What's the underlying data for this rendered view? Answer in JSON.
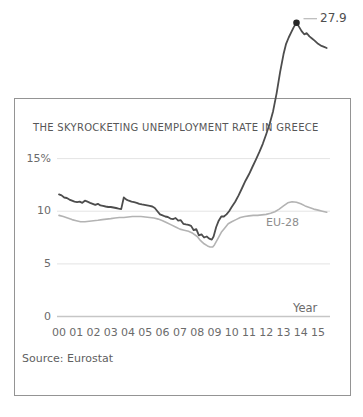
{
  "colors": {
    "greece_line": "#4d4d4d",
    "eu_line": "#b3b3b3",
    "grid": "#e4e4e4",
    "axis": "#c6c6c6",
    "frame": "#949494",
    "dot": "#262626",
    "leader": "#b8b8b8",
    "text": "#5f5f5f"
  },
  "chart_data": {
    "type": "line",
    "title": "THE SKYROCKETING UNEMPLOYMENT RATE IN GREECE",
    "source": "Source: Eurostat",
    "x_axis": {
      "label": "Year",
      "tick_labels": [
        "00",
        "01",
        "02",
        "03",
        "04",
        "05",
        "06",
        "07",
        "08",
        "09",
        "10",
        "11",
        "12",
        "13",
        "14",
        "15"
      ],
      "range_years": [
        2000,
        2015.5
      ]
    },
    "y_axis": {
      "unit": "%",
      "ticks": [
        {
          "label": "15%",
          "value": 15
        },
        {
          "label": "10",
          "value": 10
        },
        {
          "label": "5",
          "value": 5
        },
        {
          "label": "0",
          "value": 0
        }
      ],
      "grid": true
    },
    "annotation": {
      "label": "27.9",
      "year": 2013.75,
      "value": 27.9,
      "marker": "filled-dot"
    },
    "series": [
      {
        "name": "Greece",
        "label": "",
        "color": "#4d4d4d",
        "width": 1.8,
        "points": [
          [
            2000.0,
            11.6
          ],
          [
            2000.15,
            11.5
          ],
          [
            2000.3,
            11.3
          ],
          [
            2000.45,
            11.25
          ],
          [
            2000.6,
            11.1
          ],
          [
            2000.75,
            11.0
          ],
          [
            2000.9,
            10.9
          ],
          [
            2001.05,
            10.85
          ],
          [
            2001.2,
            10.9
          ],
          [
            2001.35,
            10.8
          ],
          [
            2001.5,
            11.0
          ],
          [
            2001.65,
            10.9
          ],
          [
            2001.8,
            10.8
          ],
          [
            2001.95,
            10.7
          ],
          [
            2002.1,
            10.6
          ],
          [
            2002.25,
            10.7
          ],
          [
            2002.4,
            10.55
          ],
          [
            2002.55,
            10.5
          ],
          [
            2002.7,
            10.45
          ],
          [
            2002.85,
            10.4
          ],
          [
            2003.0,
            10.4
          ],
          [
            2003.15,
            10.35
          ],
          [
            2003.3,
            10.3
          ],
          [
            2003.45,
            10.25
          ],
          [
            2003.6,
            10.2
          ],
          [
            2003.75,
            11.3
          ],
          [
            2003.9,
            11.1
          ],
          [
            2004.05,
            11.0
          ],
          [
            2004.2,
            10.9
          ],
          [
            2004.35,
            10.85
          ],
          [
            2004.5,
            10.8
          ],
          [
            2004.65,
            10.7
          ],
          [
            2004.8,
            10.65
          ],
          [
            2004.95,
            10.6
          ],
          [
            2005.1,
            10.55
          ],
          [
            2005.25,
            10.5
          ],
          [
            2005.4,
            10.45
          ],
          [
            2005.55,
            10.3
          ],
          [
            2005.7,
            10.0
          ],
          [
            2005.85,
            9.7
          ],
          [
            2006.0,
            9.6
          ],
          [
            2006.15,
            9.5
          ],
          [
            2006.3,
            9.45
          ],
          [
            2006.45,
            9.3
          ],
          [
            2006.6,
            9.25
          ],
          [
            2006.75,
            9.35
          ],
          [
            2006.9,
            9.1
          ],
          [
            2007.05,
            9.15
          ],
          [
            2007.2,
            8.8
          ],
          [
            2007.35,
            8.75
          ],
          [
            2007.5,
            8.7
          ],
          [
            2007.65,
            8.6
          ],
          [
            2007.8,
            8.2
          ],
          [
            2007.95,
            8.3
          ],
          [
            2008.1,
            7.7
          ],
          [
            2008.25,
            7.8
          ],
          [
            2008.4,
            7.5
          ],
          [
            2008.55,
            7.6
          ],
          [
            2008.7,
            7.4
          ],
          [
            2008.85,
            7.3
          ],
          [
            2008.95,
            7.6
          ],
          [
            2009.1,
            8.5
          ],
          [
            2009.25,
            9.1
          ],
          [
            2009.4,
            9.5
          ],
          [
            2009.55,
            9.5
          ],
          [
            2009.7,
            9.7
          ],
          [
            2009.85,
            10.0
          ],
          [
            2010.0,
            10.4
          ],
          [
            2010.2,
            10.9
          ],
          [
            2010.4,
            11.5
          ],
          [
            2010.6,
            12.2
          ],
          [
            2010.8,
            12.9
          ],
          [
            2011.0,
            13.5
          ],
          [
            2011.2,
            14.2
          ],
          [
            2011.4,
            14.9
          ],
          [
            2011.6,
            15.6
          ],
          [
            2011.8,
            16.4
          ],
          [
            2012.0,
            17.3
          ],
          [
            2012.2,
            18.3
          ],
          [
            2012.4,
            19.5
          ],
          [
            2012.6,
            21.2
          ],
          [
            2012.8,
            23.2
          ],
          [
            2013.0,
            24.9
          ],
          [
            2013.15,
            25.9
          ],
          [
            2013.3,
            26.5
          ],
          [
            2013.45,
            27.0
          ],
          [
            2013.6,
            27.5
          ],
          [
            2013.75,
            27.9
          ],
          [
            2013.9,
            27.5
          ],
          [
            2014.05,
            27.1
          ],
          [
            2014.2,
            26.8
          ],
          [
            2014.35,
            26.9
          ],
          [
            2014.5,
            26.6
          ],
          [
            2014.65,
            26.4
          ],
          [
            2014.8,
            26.2
          ],
          [
            2015.0,
            25.9
          ],
          [
            2015.2,
            25.7
          ],
          [
            2015.35,
            25.6
          ],
          [
            2015.5,
            25.5
          ]
        ]
      },
      {
        "name": "EU-28",
        "label": "EU-28",
        "color": "#b3b3b3",
        "width": 1.6,
        "points": [
          [
            2000.0,
            9.6
          ],
          [
            2000.25,
            9.5
          ],
          [
            2000.5,
            9.35
          ],
          [
            2000.75,
            9.2
          ],
          [
            2001.0,
            9.1
          ],
          [
            2001.25,
            9.0
          ],
          [
            2001.5,
            9.0
          ],
          [
            2001.75,
            9.05
          ],
          [
            2002.0,
            9.1
          ],
          [
            2002.25,
            9.15
          ],
          [
            2002.5,
            9.2
          ],
          [
            2002.75,
            9.25
          ],
          [
            2003.0,
            9.3
          ],
          [
            2003.25,
            9.35
          ],
          [
            2003.5,
            9.4
          ],
          [
            2003.75,
            9.4
          ],
          [
            2004.0,
            9.45
          ],
          [
            2004.25,
            9.5
          ],
          [
            2004.5,
            9.5
          ],
          [
            2004.75,
            9.5
          ],
          [
            2005.0,
            9.45
          ],
          [
            2005.25,
            9.4
          ],
          [
            2005.5,
            9.35
          ],
          [
            2005.75,
            9.25
          ],
          [
            2006.0,
            9.1
          ],
          [
            2006.25,
            8.9
          ],
          [
            2006.5,
            8.7
          ],
          [
            2006.75,
            8.5
          ],
          [
            2007.0,
            8.3
          ],
          [
            2007.25,
            8.2
          ],
          [
            2007.5,
            8.1
          ],
          [
            2007.75,
            7.9
          ],
          [
            2008.0,
            7.6
          ],
          [
            2008.2,
            7.2
          ],
          [
            2008.4,
            6.9
          ],
          [
            2008.6,
            6.7
          ],
          [
            2008.75,
            6.6
          ],
          [
            2008.9,
            6.6
          ],
          [
            2009.0,
            6.8
          ],
          [
            2009.2,
            7.4
          ],
          [
            2009.4,
            8.0
          ],
          [
            2009.6,
            8.4
          ],
          [
            2009.8,
            8.8
          ],
          [
            2010.0,
            9.0
          ],
          [
            2010.25,
            9.2
          ],
          [
            2010.5,
            9.4
          ],
          [
            2010.75,
            9.5
          ],
          [
            2011.0,
            9.55
          ],
          [
            2011.25,
            9.6
          ],
          [
            2011.5,
            9.6
          ],
          [
            2011.75,
            9.65
          ],
          [
            2012.0,
            9.7
          ],
          [
            2012.25,
            9.8
          ],
          [
            2012.5,
            9.95
          ],
          [
            2012.75,
            10.2
          ],
          [
            2013.0,
            10.5
          ],
          [
            2013.25,
            10.8
          ],
          [
            2013.5,
            10.9
          ],
          [
            2013.75,
            10.85
          ],
          [
            2014.0,
            10.7
          ],
          [
            2014.25,
            10.5
          ],
          [
            2014.5,
            10.35
          ],
          [
            2014.75,
            10.2
          ],
          [
            2015.0,
            10.1
          ],
          [
            2015.25,
            10.0
          ],
          [
            2015.5,
            9.9
          ]
        ]
      }
    ]
  }
}
